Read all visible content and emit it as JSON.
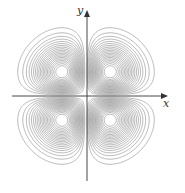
{
  "chart_data": {
    "type": "contour",
    "title": "",
    "function_description": "level curves of four-lobed surface (xy·e^(-x²-y²) style), maxima/minima in each quadrant",
    "xlabel": "x",
    "ylabel": "y",
    "grid": false,
    "legend": null,
    "num_levels_per_lobe": 20,
    "lobe_centers": [
      [
        -1,
        1
      ],
      [
        1,
        1
      ],
      [
        -1,
        -1
      ],
      [
        1,
        -1
      ]
    ],
    "xlim": [
      -3,
      3
    ],
    "ylim": [
      -3,
      3
    ],
    "colors": {
      "contour": "#8a8a8a",
      "axis": "#333333",
      "background": "#ffffff"
    }
  },
  "axes": {
    "x_label": "x",
    "y_label": "y"
  }
}
